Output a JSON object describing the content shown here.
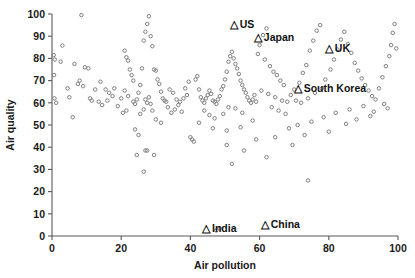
{
  "chart_data": {
    "type": "scatter",
    "title": "",
    "xlabel": "Air pollution",
    "ylabel": "Air quality",
    "xlim": [
      0,
      100
    ],
    "ylim": [
      0,
      100
    ],
    "grid": false,
    "legend": "none",
    "xticks": [
      0,
      20,
      40,
      60,
      80,
      100
    ],
    "yticks": [
      0,
      10,
      20,
      30,
      40,
      50,
      60,
      70,
      80,
      90,
      100
    ],
    "xtick_labels": [
      "0",
      "20",
      "40",
      "60",
      "80",
      "100"
    ],
    "ytick_labels": [
      "0",
      "10",
      "20",
      "30",
      "40",
      "50",
      "60",
      "70",
      "80",
      "90",
      "100"
    ],
    "marker_style": "open-circle",
    "marker_color": "#7f7f7f",
    "annotation_marker": "triangle",
    "annotations": [
      {
        "label": "US",
        "x": 52.5,
        "y": 95.5
      },
      {
        "label": "Japan",
        "x": 59.5,
        "y": 89.5
      },
      {
        "label": "UK",
        "x": 80.0,
        "y": 84.5
      },
      {
        "label": "South Korea",
        "x": 71.0,
        "y": 66.5
      },
      {
        "label": "India",
        "x": 44.5,
        "y": 3.5
      },
      {
        "label": "China",
        "x": 61.5,
        "y": 5.5
      }
    ],
    "points": [
      [
        0.5,
        81.5
      ],
      [
        0.8,
        79.5
      ],
      [
        0.6,
        72.5
      ],
      [
        0.7,
        62.0
      ],
      [
        1.2,
        60.0
      ],
      [
        2.5,
        78.5
      ],
      [
        3.0,
        85.8
      ],
      [
        4.5,
        66.5
      ],
      [
        5.0,
        62.5
      ],
      [
        8.5,
        99.5
      ],
      [
        6.5,
        77.5
      ],
      [
        9.5,
        76.0
      ],
      [
        10.5,
        75.5
      ],
      [
        11.0,
        62.0
      ],
      [
        8.0,
        70.0
      ],
      [
        9.0,
        67.5
      ],
      [
        7.5,
        68.5
      ],
      [
        11.5,
        61.0
      ],
      [
        6.0,
        53.5
      ],
      [
        12.5,
        66.0
      ],
      [
        14.0,
        69.5
      ],
      [
        15.5,
        66.0
      ],
      [
        16.0,
        61.0
      ],
      [
        16.5,
        64.5
      ],
      [
        17.5,
        63.0
      ],
      [
        18.0,
        66.5
      ],
      [
        13.5,
        60.5
      ],
      [
        14.5,
        59.0
      ],
      [
        19.0,
        58.5
      ],
      [
        20.0,
        62.0
      ],
      [
        21.0,
        83.5
      ],
      [
        21.5,
        80.5
      ],
      [
        22.0,
        79.0
      ],
      [
        22.5,
        75.0
      ],
      [
        23.0,
        72.5
      ],
      [
        23.5,
        70.0
      ],
      [
        21.0,
        65.5
      ],
      [
        22.0,
        63.0
      ],
      [
        23.5,
        60.5
      ],
      [
        24.0,
        59.5
      ],
      [
        20.5,
        55.5
      ],
      [
        21.5,
        56.5
      ],
      [
        24.5,
        61.5
      ],
      [
        25.0,
        64.5
      ],
      [
        25.5,
        68.0
      ],
      [
        26.0,
        75.5
      ],
      [
        26.5,
        88.0
      ],
      [
        27.0,
        92.0
      ],
      [
        27.5,
        95.5
      ],
      [
        28.0,
        99.0
      ],
      [
        28.5,
        90.0
      ],
      [
        29.0,
        85.5
      ],
      [
        29.5,
        75.0
      ],
      [
        30.0,
        74.5
      ],
      [
        30.5,
        70.5
      ],
      [
        31.0,
        68.5
      ],
      [
        31.5,
        65.0
      ],
      [
        32.0,
        62.0
      ],
      [
        32.5,
        61.0
      ],
      [
        33.0,
        60.5
      ],
      [
        27.0,
        61.5
      ],
      [
        27.5,
        60.0
      ],
      [
        28.0,
        62.5
      ],
      [
        28.5,
        59.5
      ],
      [
        26.5,
        57.0
      ],
      [
        25.5,
        55.0
      ],
      [
        29.0,
        56.5
      ],
      [
        30.0,
        52.5
      ],
      [
        31.5,
        51.0
      ],
      [
        24.0,
        48.0
      ],
      [
        25.0,
        45.5
      ],
      [
        24.5,
        36.5
      ],
      [
        27.0,
        38.5
      ],
      [
        27.5,
        38.5
      ],
      [
        29.5,
        36.5
      ],
      [
        26.5,
        29.0
      ],
      [
        40.5,
        43.5
      ],
      [
        41.0,
        42.5
      ],
      [
        40.0,
        44.5
      ],
      [
        34.0,
        66.0
      ],
      [
        35.0,
        64.5
      ],
      [
        36.0,
        61.5
      ],
      [
        37.0,
        60.5
      ],
      [
        38.0,
        62.0
      ],
      [
        39.0,
        63.5
      ],
      [
        33.5,
        58.0
      ],
      [
        35.5,
        57.0
      ],
      [
        37.5,
        56.0
      ],
      [
        36.5,
        59.0
      ],
      [
        34.5,
        55.5
      ],
      [
        38.5,
        66.5
      ],
      [
        39.5,
        69.5
      ],
      [
        41.5,
        70.5
      ],
      [
        42.0,
        72.0
      ],
      [
        42.5,
        66.0
      ],
      [
        43.0,
        62.5
      ],
      [
        43.5,
        61.0
      ],
      [
        44.0,
        60.0
      ],
      [
        44.5,
        62.0
      ],
      [
        45.0,
        63.5
      ],
      [
        45.5,
        65.5
      ],
      [
        46.0,
        64.0
      ],
      [
        46.5,
        61.0
      ],
      [
        47.0,
        60.5
      ],
      [
        47.5,
        59.5
      ],
      [
        48.0,
        61.5
      ],
      [
        48.5,
        63.0
      ],
      [
        49.0,
        66.0
      ],
      [
        49.5,
        67.5
      ],
      [
        50.0,
        70.5
      ],
      [
        50.5,
        74.0
      ],
      [
        51.0,
        78.5
      ],
      [
        51.5,
        81.0
      ],
      [
        52.0,
        83.0
      ],
      [
        52.5,
        80.0
      ],
      [
        53.0,
        77.5
      ],
      [
        53.5,
        75.5
      ],
      [
        54.0,
        73.0
      ],
      [
        54.5,
        70.0
      ],
      [
        55.0,
        68.0
      ],
      [
        55.5,
        66.0
      ],
      [
        56.0,
        64.5
      ],
      [
        56.5,
        62.5
      ],
      [
        57.0,
        61.0
      ],
      [
        57.5,
        60.0
      ],
      [
        58.0,
        61.5
      ],
      [
        58.5,
        63.5
      ],
      [
        59.0,
        60.5
      ],
      [
        44.0,
        56.5
      ],
      [
        45.5,
        54.5
      ],
      [
        47.0,
        53.0
      ],
      [
        49.5,
        55.0
      ],
      [
        51.0,
        58.0
      ],
      [
        53.0,
        57.5
      ],
      [
        55.0,
        55.5
      ],
      [
        42.5,
        51.0
      ],
      [
        46.5,
        48.5
      ],
      [
        50.5,
        47.5
      ],
      [
        54.5,
        49.0
      ],
      [
        58.0,
        52.0
      ],
      [
        60.0,
        86.0
      ],
      [
        61.0,
        90.5
      ],
      [
        62.0,
        93.5
      ],
      [
        59.5,
        82.0
      ],
      [
        61.5,
        79.5
      ],
      [
        63.0,
        76.5
      ],
      [
        64.0,
        74.0
      ],
      [
        65.0,
        72.5
      ],
      [
        66.0,
        70.0
      ],
      [
        67.0,
        68.0
      ],
      [
        60.5,
        65.5
      ],
      [
        62.5,
        64.0
      ],
      [
        64.5,
        62.5
      ],
      [
        66.5,
        61.0
      ],
      [
        68.0,
        60.5
      ],
      [
        63.5,
        58.0
      ],
      [
        65.5,
        56.5
      ],
      [
        67.5,
        55.0
      ],
      [
        69.0,
        63.5
      ],
      [
        70.0,
        66.0
      ],
      [
        71.5,
        69.0
      ],
      [
        72.5,
        73.5
      ],
      [
        73.5,
        77.0
      ],
      [
        74.5,
        83.5
      ],
      [
        75.5,
        88.0
      ],
      [
        76.5,
        92.5
      ],
      [
        77.5,
        95.0
      ],
      [
        70.5,
        61.0
      ],
      [
        72.0,
        60.0
      ],
      [
        74.0,
        62.0
      ],
      [
        76.0,
        64.5
      ],
      [
        78.0,
        66.5
      ],
      [
        79.0,
        70.5
      ],
      [
        80.5,
        75.0
      ],
      [
        81.5,
        79.5
      ],
      [
        82.5,
        84.0
      ],
      [
        83.5,
        88.5
      ],
      [
        84.5,
        92.0
      ],
      [
        85.5,
        86.5
      ],
      [
        86.5,
        82.5
      ],
      [
        87.5,
        78.0
      ],
      [
        88.5,
        74.5
      ],
      [
        89.5,
        71.0
      ],
      [
        90.5,
        68.0
      ],
      [
        91.5,
        65.5
      ],
      [
        92.5,
        63.0
      ],
      [
        93.5,
        61.5
      ],
      [
        94.5,
        66.5
      ],
      [
        95.5,
        71.5
      ],
      [
        96.5,
        76.5
      ],
      [
        97.5,
        81.0
      ],
      [
        98.0,
        86.0
      ],
      [
        98.5,
        91.5
      ],
      [
        99.0,
        95.5
      ],
      [
        99.5,
        84.5
      ],
      [
        96.0,
        59.5
      ],
      [
        97.0,
        57.5
      ],
      [
        93.0,
        56.0
      ],
      [
        90.0,
        58.5
      ],
      [
        86.0,
        57.0
      ],
      [
        82.0,
        55.5
      ],
      [
        78.5,
        53.5
      ],
      [
        75.0,
        51.5
      ],
      [
        71.0,
        50.0
      ],
      [
        68.5,
        48.5
      ],
      [
        73.0,
        45.5
      ],
      [
        80.0,
        47.0
      ],
      [
        85.0,
        50.5
      ],
      [
        88.0,
        52.5
      ],
      [
        92.0,
        54.0
      ],
      [
        74.0,
        25.0
      ],
      [
        62.0,
        35.5
      ],
      [
        55.5,
        38.5
      ],
      [
        50.5,
        41.0
      ],
      [
        52.0,
        32.5
      ],
      [
        47.5,
        2.5
      ],
      [
        48.5,
        3.5
      ],
      [
        64.5,
        44.5
      ],
      [
        69.5,
        41.0
      ],
      [
        59.0,
        43.5
      ]
    ]
  }
}
